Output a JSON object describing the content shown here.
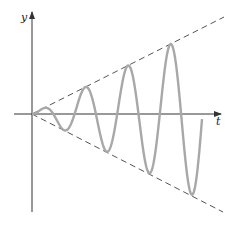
{
  "chart_data": {
    "type": "line",
    "title": "",
    "xlabel": "t",
    "ylabel": "y",
    "grid": false,
    "legend": [],
    "series": [
      {
        "name": "oscillation",
        "style": "solid",
        "color": "#a8a8a8",
        "function": "y = k*t*sin(omega*t)",
        "cycles": 4,
        "peaks_px": [
          [
            46,
            107
          ],
          [
            87,
            88
          ],
          [
            128,
            66
          ],
          [
            171,
            44
          ]
        ],
        "troughs_px": [
          [
            65,
            130
          ],
          [
            107,
            152
          ],
          [
            149,
            174
          ],
          [
            192,
            196
          ]
        ]
      },
      {
        "name": "upper-envelope",
        "style": "dashed",
        "color": "#555555",
        "function": "y = k*t"
      },
      {
        "name": "lower-envelope",
        "style": "dashed",
        "color": "#555555",
        "function": "y = -k*t"
      }
    ]
  },
  "axes": {
    "x_label": "t",
    "y_label": "y",
    "axis_color": "#333333"
  },
  "colors": {
    "curve": "#a8a8a8",
    "envelope": "#555555",
    "axis": "#333333"
  }
}
